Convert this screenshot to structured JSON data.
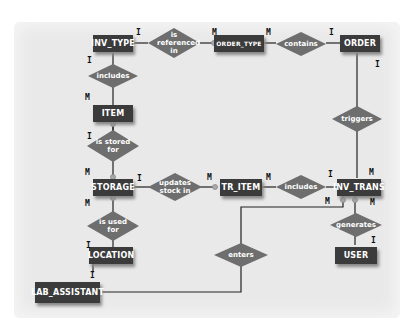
{
  "entities": {
    "inv_type": "INV_TYPE",
    "order_type": "ORDER_TYPE",
    "order": "ORDER",
    "item": "ITEM",
    "storage": "STORAGE",
    "tr_item": "TR_ITEM",
    "inv_trans": "INV_TRANS",
    "location": "LOCATION",
    "user": "USER",
    "lab_assistant": "LAB_ASSISTANT"
  },
  "relationships": {
    "is_referenced_in": "is referenced in",
    "contains": "contains",
    "includes_1": "includes",
    "triggers": "triggers",
    "is_stored_for": "is stored for",
    "updates_stock_in": "updates stock in",
    "includes_2": "includes",
    "is_used_for": "is used for",
    "generates": "generates",
    "enters": "enters"
  },
  "cardinalities": {
    "c1": "I",
    "c2": "M",
    "c3": "M",
    "c4": "I",
    "c5": "I",
    "c6": "I",
    "c7": "M",
    "c8": "I",
    "c9": "M",
    "c10": "I",
    "c11": "M",
    "c12": "M",
    "c13": "I",
    "c14": "M",
    "c15": "M",
    "c16": "M",
    "c17": "M",
    "c18": "I",
    "c19": "I",
    "c20": "I"
  }
}
